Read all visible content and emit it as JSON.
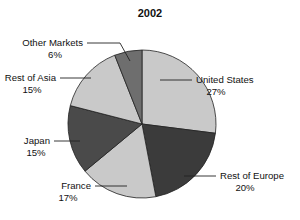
{
  "chart_data": {
    "type": "pie",
    "title": "2002",
    "xlabel": "",
    "ylabel": "",
    "legend_position": "none",
    "grid": false,
    "start_angle_deg": 0,
    "direction": "clockwise",
    "categories": [
      "United States",
      "Rest of Europe",
      "France",
      "Japan",
      "Rest of Asia",
      "Other Markets"
    ],
    "values": [
      27,
      20,
      17,
      15,
      15,
      6
    ],
    "value_suffix": "%",
    "labels": [
      "United States 27%",
      "Rest of Europe 20%",
      "France 17%",
      "Japan 15%",
      "Rest of Asia 15%",
      "Other Markets 6%"
    ],
    "slice_colors": [
      "#c9c9c9",
      "#3b3b3b",
      "#c9c9c9",
      "#4a4a4a",
      "#c9c9c9",
      "#6e6e6e"
    ],
    "slices": [
      {
        "name": "United States",
        "value": 27,
        "value_text": "27%",
        "color": "#c9c9c9"
      },
      {
        "name": "Rest of Europe",
        "value": 20,
        "value_text": "20%",
        "color": "#3b3b3b"
      },
      {
        "name": "France",
        "value": 17,
        "value_text": "17%",
        "color": "#c9c9c9"
      },
      {
        "name": "Japan",
        "value": 15,
        "value_text": "15%",
        "color": "#4a4a4a"
      },
      {
        "name": "Rest of Asia",
        "value": 15,
        "value_text": "15%",
        "color": "#c9c9c9"
      },
      {
        "name": "Other Markets",
        "value": 6,
        "value_text": "6%",
        "color": "#6e6e6e"
      }
    ]
  },
  "chart": {
    "title": "2002",
    "slice_0_label": "United States",
    "slice_0_value": "27%",
    "slice_1_label": "Rest of Europe",
    "slice_1_value": "20%",
    "slice_2_label": "France",
    "slice_2_value": "17%",
    "slice_3_label": "Japan",
    "slice_3_value": "15%",
    "slice_4_label": "Rest of Asia",
    "slice_4_value": "15%",
    "slice_5_label": "Other Markets",
    "slice_5_value": "6%"
  },
  "colors": {
    "background": "#ffffff",
    "text": "#111111",
    "outline": "#222222",
    "light_gray": "#c9c9c9",
    "mid_gray": "#6e6e6e",
    "dark_gray": "#3b3b3b",
    "dark_gray_alt": "#4a4a4a"
  }
}
